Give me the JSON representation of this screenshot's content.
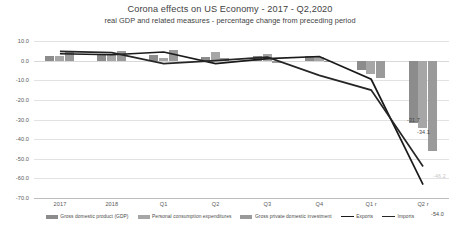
{
  "chart_data": {
    "type": "bar",
    "title": "Corona effects on US Economy - 2017 - Q2,2020",
    "subtitle": "real GDP and related measures - percentage change from preceding period",
    "xlabel": "",
    "ylabel": "",
    "categories": [
      "2017",
      "2018",
      "Q1",
      "Q2",
      "Q3",
      "Q4",
      "Q1 r",
      "Q2 r"
    ],
    "ylim": [
      -70.0,
      10.0
    ],
    "yticks": [
      "10.0",
      "0.0",
      "-10.0",
      "-20.0",
      "-30.0",
      "-40.0",
      "-50.0",
      "-60.0",
      "-70.0"
    ],
    "ytick_values": [
      10.0,
      0.0,
      -10.0,
      -20.0,
      -30.0,
      -40.0,
      -50.0,
      -60.0,
      -70.0
    ],
    "grid": true,
    "legend_position": "bottom",
    "series": [
      {
        "name": "Gross domestic product (GDP)",
        "kind": "bar",
        "color": "#8c8c8c",
        "values": [
          2.4,
          2.9,
          3.1,
          2.0,
          2.6,
          2.4,
          -5.0,
          -31.7
        ]
      },
      {
        "name": "Personal consumption expenditures",
        "kind": "bar",
        "color": "#a6a6a6",
        "values": [
          2.6,
          3.0,
          1.1,
          4.6,
          3.2,
          1.8,
          -6.9,
          -34.1
        ]
      },
      {
        "name": "Gross private domestic investment",
        "kind": "bar",
        "color": "#9a9a9a",
        "values": [
          4.8,
          5.1,
          5.6,
          1.2,
          -1.0,
          -0.3,
          -9.0,
          -46.2
        ]
      },
      {
        "name": "Exports",
        "kind": "line",
        "color": "#1a1a1a",
        "values": [
          3.5,
          3.0,
          4.4,
          -1.5,
          1.0,
          2.1,
          -9.5,
          -63.2
        ]
      },
      {
        "name": "Imports",
        "kind": "line",
        "color": "#262626",
        "values": [
          4.7,
          4.1,
          -1.5,
          0.0,
          1.8,
          -7.5,
          -15.0,
          -54.0
        ]
      }
    ],
    "data_labels": [
      {
        "text": "-31.7",
        "series": "Gross domestic product (GDP)",
        "category": "Q2 r",
        "faint": false
      },
      {
        "text": "-34.1",
        "series": "Personal consumption expenditures",
        "category": "Q2 r",
        "faint": false
      },
      {
        "text": "-46.2",
        "series": "Gross private domestic investment",
        "category": "Q2 r",
        "faint": true
      },
      {
        "text": "-54.0",
        "series": "Imports",
        "category": "Q2 r",
        "faint": false
      },
      {
        "text": "-63.2",
        "series": "Exports",
        "category": "Q2 r",
        "faint": false
      }
    ]
  }
}
